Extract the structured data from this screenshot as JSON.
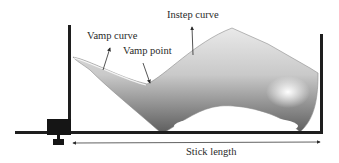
{
  "diagram": {
    "labels": {
      "vamp_curve": "Vamp curve",
      "vamp_point": "Vamp point",
      "instep_curve": "Instep curve",
      "stick_length": "Stick length"
    },
    "colors": {
      "frame": "#1e1e1e",
      "label_text": "#2a2a2a",
      "last_light": "#f4f4f4",
      "last_dark": "#6e6e6e"
    }
  }
}
